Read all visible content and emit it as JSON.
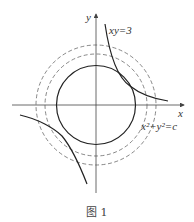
{
  "figure": {
    "caption": "图 1",
    "axes": {
      "x_label": "x",
      "y_label": "y"
    },
    "curves": {
      "hyperbola_label": "xy=3",
      "circle_family_label": "x²+y²=c"
    },
    "colors": {
      "stroke": "#222222",
      "dashed": "#555555",
      "axis": "#444444"
    }
  }
}
